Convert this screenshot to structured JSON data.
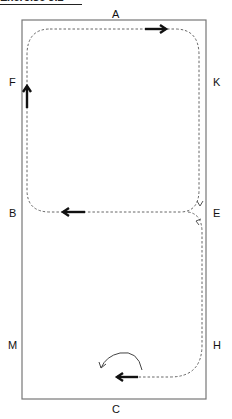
{
  "title": "Exercise 3.2",
  "arena": {
    "letters": {
      "top": "A",
      "bottom": "C",
      "left_upper": "F",
      "left_middle": "B",
      "left_lower": "M",
      "right_upper": "K",
      "right_middle": "E",
      "right_lower": "H"
    }
  },
  "path": {
    "style": "dashed",
    "directions": [
      "right along A side",
      "down K side",
      "left across at E to B",
      "up F side",
      "split at E down to H",
      "left along C side then turn"
    ]
  },
  "colors": {
    "border": "#777777",
    "path": "#666666",
    "arrow": "#111111"
  }
}
